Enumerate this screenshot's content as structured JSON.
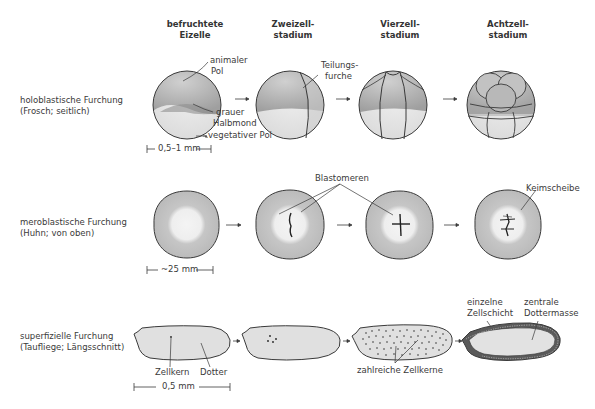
{
  "columns": [
    {
      "line1": "befruchtete",
      "line2": "Eizelle"
    },
    {
      "line1": "Zweizell-",
      "line2": "stadium"
    },
    {
      "line1": "Vierzell-",
      "line2": "stadium"
    },
    {
      "line1": "Achtzell-",
      "line2": "stadium"
    }
  ],
  "rows": [
    {
      "line1": "holoblastische Furchung",
      "line2": "(Frosch; seitlich)",
      "scale": "0,5–1 mm",
      "labels": {
        "animal_pole_1": "animaler",
        "animal_pole_2": "Pol",
        "gray_crescent_1": "grauer",
        "gray_crescent_2": "Halbmond",
        "vegetal_pole": "vegetativer Pol",
        "cleavage_furrow_1": "Teilungs-",
        "cleavage_furrow_2": "furche"
      }
    },
    {
      "line1": "meroblastische Furchung",
      "line2": "(Huhn; von oben)",
      "scale": "~25 mm",
      "labels": {
        "blastomeres": "Blastomeren",
        "blastodisc": "Keimscheibe"
      }
    },
    {
      "line1": "superfizielle Furchung",
      "line2": "(Taufliege; Längsschnitt)",
      "scale": "0,5 mm",
      "labels": {
        "nucleus": "Zellkern",
        "yolk": "Dotter",
        "many_nuclei": "zahlreiche Zellkerne",
        "single_layer_1": "einzelne",
        "single_layer_2": "Zellschicht",
        "central_yolk_1": "zentrale",
        "central_yolk_2": "Dottermasse"
      }
    }
  ],
  "colors": {
    "outline": "#3a3a3a",
    "animal_hemisphere": "#b9b9b9",
    "vegetal_hemisphere": "#e2e2e2",
    "disc_outer": "#bdbdbd",
    "disc_inner": "#ececec",
    "fly_egg": "#e0e0e0"
  }
}
